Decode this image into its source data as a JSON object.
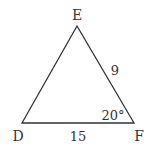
{
  "diagram": {
    "type": "triangle",
    "vertices": {
      "E": {
        "label": "E"
      },
      "D": {
        "label": "D"
      },
      "F": {
        "label": "F"
      }
    },
    "sides": {
      "DF": {
        "label": "15"
      },
      "EF": {
        "label": "9"
      }
    },
    "angles": {
      "F": {
        "label": "20°"
      }
    },
    "colors": {
      "stroke": "#333333",
      "text": "#333333",
      "background": "#ffffff"
    }
  }
}
